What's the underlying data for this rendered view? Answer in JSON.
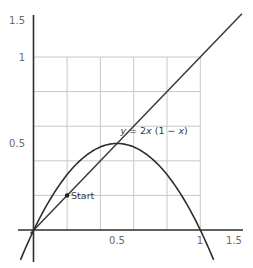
{
  "chart_data": {
    "type": "line",
    "title": "",
    "xlabel": "",
    "ylabel": "",
    "xlim": [
      -0.02,
      1.55
    ],
    "ylim": [
      -0.2,
      1.5
    ],
    "grid": {
      "on": true,
      "x_from": 0,
      "x_to": 1,
      "y_from": 0,
      "y_to": 1,
      "step": 0.2
    },
    "x_ticks": [
      {
        "value": 0.5,
        "label": "0.5"
      },
      {
        "value": 1,
        "label": "1"
      },
      {
        "value": 1.5,
        "label": "1.5"
      }
    ],
    "y_ticks": [
      {
        "value": 0.5,
        "label": "0.5"
      },
      {
        "value": 1,
        "label": "1"
      },
      {
        "value": 1.5,
        "label": "1.5"
      }
    ],
    "series": [
      {
        "name": "y = x",
        "expression": "y = x",
        "x": [
          -0.02,
          1.25
        ],
        "y": [
          -0.02,
          1.25
        ]
      },
      {
        "name": "y = 2x(1 − x)",
        "expression": "y = 2x (1 − x)",
        "x": [
          -0.08,
          0.0,
          0.1,
          0.2,
          0.3,
          0.4,
          0.5,
          0.6,
          0.7,
          0.8,
          0.9,
          1.0,
          1.08
        ],
        "y": [
          -0.17,
          0.0,
          0.18,
          0.32,
          0.42,
          0.48,
          0.5,
          0.48,
          0.42,
          0.32,
          0.18,
          0.0,
          -0.17
        ]
      }
    ],
    "annotations": [
      {
        "text": "y = 2x (1 − x)",
        "x": 0.52,
        "y": 0.53
      },
      {
        "text": "Start",
        "x": 0.2,
        "y": 0.2,
        "marker": "point"
      }
    ]
  },
  "labels": {
    "curve_label_y": "y",
    "curve_label_eq": " = 2",
    "curve_label_x1": "x",
    "curve_label_mid": " (1 − ",
    "curve_label_x2": "x",
    "curve_label_end": ")",
    "start": "Start",
    "x_tick_05": "0.5",
    "x_tick_1": "1",
    "x_tick_15": "1.5",
    "y_tick_05": "0.5",
    "y_tick_1": "1",
    "y_tick_15": "1.5"
  }
}
